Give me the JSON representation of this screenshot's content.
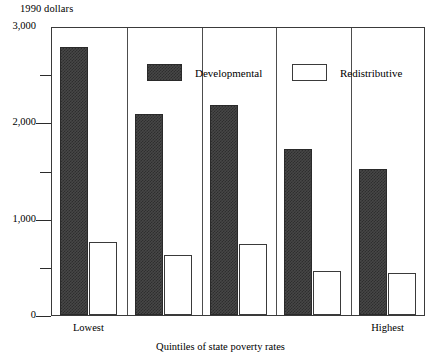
{
  "chart_data": {
    "type": "bar",
    "title": "",
    "unit_label": "1990 dollars",
    "xlabel": "Quintiles of state poverty rates",
    "ylabel": "1990 dollars",
    "categories": [
      "Lowest",
      "",
      "",
      "",
      "Highest"
    ],
    "visible_category_labels": [
      "Lowest",
      "Highest"
    ],
    "series": [
      {
        "name": "Developmental",
        "fill": "dark-hatched",
        "color": "#474747",
        "values": [
          2780,
          2090,
          2180,
          1720,
          1520
        ]
      },
      {
        "name": "Redistributive",
        "fill": "white-outline",
        "color": "#ffffff",
        "values": [
          760,
          620,
          740,
          460,
          440
        ]
      }
    ],
    "ylim": [
      0,
      3000
    ],
    "ytick_labels": [
      "0",
      "1,000",
      "2,000",
      "3,000"
    ],
    "ytick_values": [
      0,
      1000,
      2000,
      3000
    ],
    "yminor_values": [
      500,
      1500,
      2500
    ],
    "grid": false,
    "legend_position": "top-inside"
  },
  "legend": {
    "items": [
      {
        "label": "Developmental"
      },
      {
        "label": "Redistributive"
      }
    ]
  },
  "axis": {
    "unit_label": "1990 dollars",
    "x_title": "Quintiles of state poverty rates",
    "x_first_label": "Lowest",
    "x_last_label": "Highest"
  },
  "colors": {
    "bar_developmental": "#474747",
    "bar_redistributive": "#ffffff",
    "frame": "#3a3a3a",
    "text": "#000000"
  }
}
